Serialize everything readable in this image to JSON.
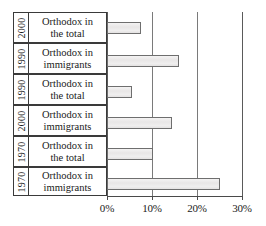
{
  "chart_data": {
    "type": "bar",
    "orientation": "horizontal",
    "title": "",
    "xlabel": "",
    "ylabel": "",
    "grid": true,
    "legend": null,
    "xlim": [
      0,
      30
    ],
    "x_tick_labels": [
      "0%",
      "10%",
      "20%",
      "30%"
    ],
    "x_tick_values": [
      0,
      10,
      20,
      30
    ],
    "categories": [
      "2000 Orthodox in the total",
      "1990 Orthodox in immigrants",
      "1990 Orthodox in the total",
      "2000 Orthodox in immigrants",
      "1970 Orthodox in the total",
      "1970 Orthodox in immigrants"
    ],
    "values": [
      7.5,
      16,
      5.5,
      14.5,
      10.3,
      25
    ],
    "value_unit": "%",
    "bar_fill": "#ebe9e9",
    "bar_border": "#6e6e6e",
    "rows": [
      {
        "year": "2000",
        "label_line1": "Orthodox in",
        "label_line2": "the total",
        "value": 7.5
      },
      {
        "year": "1990",
        "label_line1": "Orthodox in",
        "label_line2": "immigrants",
        "value": 16
      },
      {
        "year": "1990",
        "label_line1": "Orthodox in",
        "label_line2": "the total",
        "value": 5.5
      },
      {
        "year": "2000",
        "label_line1": "Orthodox in",
        "label_line2": "immigrants",
        "value": 14.5
      },
      {
        "year": "1970",
        "label_line1": "Orthodox in",
        "label_line2": "the total",
        "value": 10.3
      },
      {
        "year": "1970",
        "label_line1": "Orthodox in",
        "label_line2": "immigrants",
        "value": 25
      }
    ]
  }
}
